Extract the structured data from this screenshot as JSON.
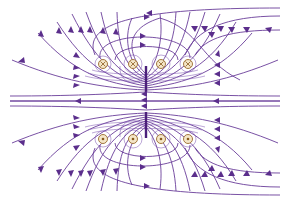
{
  "diagram": {
    "title": "",
    "colors": {
      "field_line": "#6a3d9a",
      "arrow": "#5b2e8c",
      "conductor_fill": "#f4e6c8",
      "conductor_stroke": "#9a6b2e",
      "background": "#ffffff"
    },
    "conductors": {
      "top_row": [
        {
          "x": 103,
          "y": 64,
          "symbol": "cross"
        },
        {
          "x": 133,
          "y": 64,
          "symbol": "cross"
        },
        {
          "x": 161,
          "y": 64,
          "symbol": "cross"
        },
        {
          "x": 188,
          "y": 64,
          "symbol": "cross"
        }
      ],
      "bottom_row": [
        {
          "x": 103,
          "y": 139,
          "symbol": "dot"
        },
        {
          "x": 133,
          "y": 139,
          "symbol": "dot"
        },
        {
          "x": 161,
          "y": 139,
          "symbol": "dot"
        },
        {
          "x": 188,
          "y": 139,
          "symbol": "dot"
        }
      ]
    },
    "field_direction_axis": "right-to-left along central axis",
    "labels": []
  }
}
